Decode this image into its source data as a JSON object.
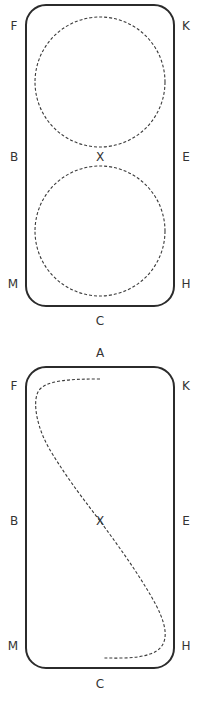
{
  "diagrams": [
    {
      "id": "serpentine-two-loops",
      "description": "Arena with two dashed 20m circles (figure of eight) meeting at X",
      "markers": {
        "top_left": "F",
        "top_right": "K",
        "mid_left": "B",
        "center": "X",
        "mid_right": "E",
        "bottom_left": "M",
        "bottom_right": "H",
        "bottom": "C"
      }
    },
    {
      "id": "change-of-rein-diagonal",
      "caption_above": "A",
      "description": "Arena with dashed S-shaped line from A side across X to C side",
      "markers": {
        "top": "A",
        "top_left": "F",
        "top_right": "K",
        "mid_left": "B",
        "center": "X",
        "mid_right": "E",
        "bottom_left": "M",
        "bottom_right": "H",
        "bottom": "C"
      }
    }
  ],
  "colors": {
    "arena_outline": "#2b2b2b",
    "dashed_path": "#3a3a3a",
    "label_text": "#333333",
    "background": "#ffffff"
  }
}
